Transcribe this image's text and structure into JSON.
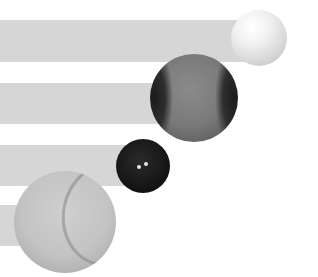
{
  "chart_data": {
    "type": "bar",
    "orientation": "horizontal",
    "title": "",
    "xlabel": "",
    "ylabel": "",
    "categories": [
      "Golf ball",
      "Baseball",
      "Squash ball",
      "Tennis ball"
    ],
    "values": [
      259,
      194,
      143,
      65
    ],
    "value_units": "bar length in pixels (no axis shown)",
    "grid": false,
    "legend": "none",
    "bars": [
      {
        "category": "Golf ball",
        "y": 20,
        "height": 42,
        "length": 259,
        "ball_cx": 259,
        "ball_cy": 38,
        "ball_r": 28,
        "ball_style": "golf"
      },
      {
        "category": "Baseball",
        "y": 83,
        "height": 41,
        "length": 194,
        "ball_cx": 194,
        "ball_cy": 98,
        "ball_r": 44,
        "ball_style": "baseball"
      },
      {
        "category": "Squash ball",
        "y": 145,
        "height": 41,
        "length": 143,
        "ball_cx": 143,
        "ball_cy": 166,
        "ball_r": 27,
        "ball_style": "squash"
      },
      {
        "category": "Tennis ball",
        "y": 205,
        "height": 41,
        "length": 65,
        "ball_cx": 65,
        "ball_cy": 222,
        "ball_r": 51,
        "ball_style": "tennis"
      }
    ]
  },
  "colors": {
    "background": "#ffffff",
    "bar": "#d6d6d6"
  }
}
